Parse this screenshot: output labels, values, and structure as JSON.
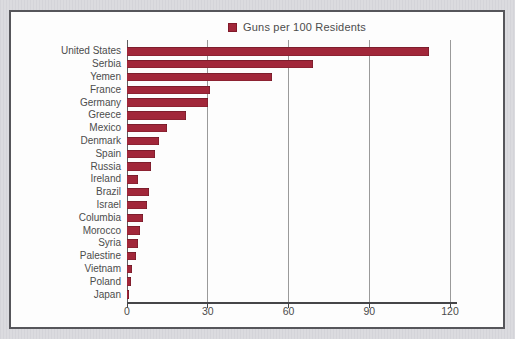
{
  "colors": {
    "page_background": "#d8d8dc",
    "frame_border": "#56565b",
    "panel": "#fdfdfd",
    "gridline": "#9a9a9a",
    "axis": "#454548",
    "text": "#4c4c4c"
  },
  "chart_data": {
    "type": "bar",
    "orientation": "horizontal",
    "title": "",
    "legend": [
      "Guns per 100 Residents"
    ],
    "legend_position": "top-center",
    "bar_color": "#a1273a",
    "categories": [
      "United States",
      "Serbia",
      "Yemen",
      "France",
      "Germany",
      "Greece",
      "Mexico",
      "Denmark",
      "Spain",
      "Russia",
      "Ireland",
      "Brazil",
      "Israel",
      "Columbia",
      "Morocco",
      "Syria",
      "Palestine",
      "Vietnam",
      "Poland",
      "Japan"
    ],
    "values": [
      112,
      69,
      54,
      31,
      30,
      22,
      15,
      12,
      10.4,
      8.9,
      4.1,
      8,
      7.3,
      5.9,
      4.8,
      3.9,
      3.4,
      1.7,
      1.3,
      0.6
    ],
    "xlabel": "",
    "ylabel": "",
    "xlim": [
      0,
      120
    ],
    "xticks": [
      0,
      30,
      60,
      90,
      120
    ],
    "grid": true
  }
}
